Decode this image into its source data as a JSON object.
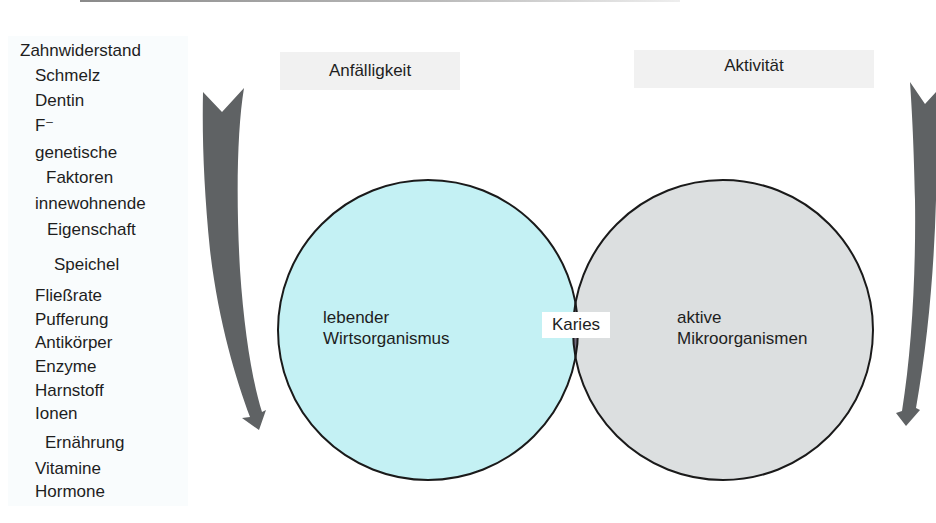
{
  "colors": {
    "host_circle": "#c4f1f4",
    "microbe_circle": "#dcdfe0",
    "overlap": "#736b7e",
    "arrow": "#5f6264",
    "outline": "#1a1a1a"
  },
  "left_factors": [
    {
      "text": "Zahnwiderstand",
      "type": "heading"
    },
    {
      "text": "Schmelz",
      "type": "item"
    },
    {
      "text": "Dentin",
      "type": "item"
    },
    {
      "text": "F⁻",
      "type": "item"
    },
    {
      "text": "genetische",
      "type": "item"
    },
    {
      "text": "Faktoren",
      "type": "item"
    },
    {
      "text": "innewohnende",
      "type": "item"
    },
    {
      "text": "Eigenschaft",
      "type": "item"
    },
    {
      "text": "Speichel",
      "type": "heading"
    },
    {
      "text": "Fließrate",
      "type": "item"
    },
    {
      "text": "Pufferung",
      "type": "item"
    },
    {
      "text": "Antikörper",
      "type": "item"
    },
    {
      "text": "Enzyme",
      "type": "item"
    },
    {
      "text": "Harnstoff",
      "type": "item"
    },
    {
      "text": "Ionen",
      "type": "item"
    },
    {
      "text": "Ernährung",
      "type": "heading"
    },
    {
      "text": "Vitamine",
      "type": "item"
    },
    {
      "text": "Hormone",
      "type": "item"
    }
  ],
  "headers": {
    "left": "Anfälligkeit",
    "right": "Aktivität"
  },
  "circles": {
    "left": {
      "line1": "lebender",
      "line2": "Wirtsorganismus"
    },
    "right": {
      "line1": "aktive",
      "line2": "Mikroorganismen"
    },
    "overlap": "Karies"
  }
}
